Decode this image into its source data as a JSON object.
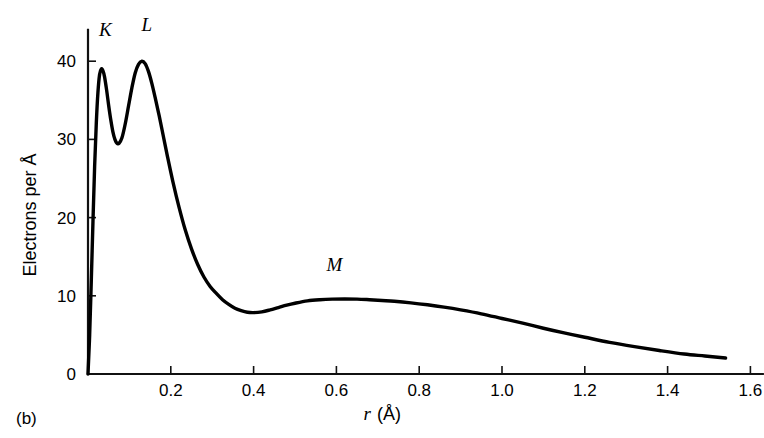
{
  "figure": {
    "panel_label": "(b)",
    "background": "#ffffff",
    "curve_color": "#000000",
    "axis_color": "#111111"
  },
  "chart_data": {
    "type": "line",
    "title": "",
    "subtitle": "",
    "xlabel_italic": "r",
    "xlabel_unit": "(Å)",
    "xlabel": "r (Å)",
    "ylabel": "Electrons per Å",
    "xlim": [
      0.0,
      1.63
    ],
    "ylim": [
      0,
      44
    ],
    "xticks": [
      0.2,
      0.4,
      0.6,
      0.8,
      1.0,
      1.2,
      1.4,
      1.6
    ],
    "xtick_labels": [
      "0.2",
      "0.4",
      "0.6",
      "0.8",
      "1.0",
      "1.2",
      "1.4",
      "1.6"
    ],
    "yticks": [
      0,
      10,
      20,
      30,
      40
    ],
    "ytick_labels": [
      "0",
      "10",
      "20",
      "30",
      "40"
    ],
    "grid": false,
    "legend": "none",
    "annotations": [
      {
        "text": "K",
        "x": 0.042,
        "y": 43.2
      },
      {
        "text": "L",
        "x": 0.142,
        "y": 43.8
      },
      {
        "text": "M",
        "x": 0.595,
        "y": 13.2
      }
    ],
    "x": [
      0.0,
      0.004,
      0.008,
      0.012,
      0.016,
      0.02,
      0.024,
      0.028,
      0.032,
      0.036,
      0.04,
      0.045,
      0.05,
      0.055,
      0.06,
      0.065,
      0.07,
      0.075,
      0.082,
      0.09,
      0.098,
      0.106,
      0.114,
      0.122,
      0.13,
      0.138,
      0.146,
      0.154,
      0.162,
      0.172,
      0.182,
      0.192,
      0.205,
      0.22,
      0.235,
      0.25,
      0.265,
      0.28,
      0.295,
      0.31,
      0.325,
      0.34,
      0.355,
      0.37,
      0.385,
      0.4,
      0.42,
      0.44,
      0.46,
      0.48,
      0.5,
      0.53,
      0.56,
      0.59,
      0.62,
      0.65,
      0.68,
      0.71,
      0.74,
      0.78,
      0.82,
      0.86,
      0.9,
      0.95,
      1.0,
      1.05,
      1.1,
      1.15,
      1.2,
      1.26,
      1.32,
      1.38,
      1.44,
      1.49,
      1.54
    ],
    "y": [
      0.0,
      5.0,
      12.0,
      19.5,
      26.5,
      32.0,
      36.0,
      38.3,
      39.0,
      38.8,
      38.0,
      36.3,
      34.3,
      32.5,
      31.0,
      30.0,
      29.5,
      29.5,
      30.2,
      32.0,
      34.3,
      36.6,
      38.5,
      39.6,
      40.0,
      39.7,
      38.7,
      37.2,
      35.4,
      33.0,
      30.4,
      27.8,
      24.6,
      21.3,
      18.4,
      16.0,
      14.0,
      12.4,
      11.2,
      10.3,
      9.5,
      8.9,
      8.4,
      8.1,
      7.9,
      7.85,
      7.95,
      8.2,
      8.5,
      8.8,
      9.05,
      9.35,
      9.5,
      9.58,
      9.6,
      9.58,
      9.5,
      9.4,
      9.3,
      9.1,
      8.85,
      8.55,
      8.2,
      7.7,
      7.1,
      6.5,
      5.85,
      5.25,
      4.7,
      4.05,
      3.5,
      3.0,
      2.55,
      2.3,
      2.05
    ]
  }
}
